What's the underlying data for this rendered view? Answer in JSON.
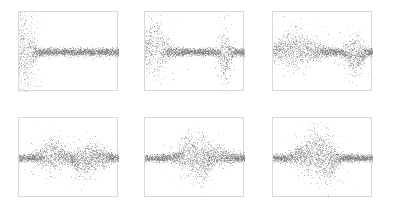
{
  "figure": {
    "title": "",
    "background_color": "#ffffff",
    "width": 395,
    "height": 210,
    "panel_border_color": "#d8d8d8",
    "point_color": "#7a7a7a",
    "point_alpha": 0.55,
    "point_size": 0.9,
    "rows": 2,
    "cols": 3
  },
  "chart_data": {
    "type": "scatter",
    "title": "",
    "subtitle": "",
    "xlabel": "",
    "ylabel": "",
    "grid": false,
    "legend": null,
    "shared_axes": {
      "xlim": [
        0,
        1
      ],
      "ylim": [
        -1,
        1
      ],
      "xticks": [],
      "yticks": [],
      "tick_labels_visible": false,
      "axis_labels_visible": false
    },
    "panels": [
      {
        "id": "panel-1",
        "row": 0,
        "col": 0,
        "position_px": {
          "x": 18,
          "y": 11,
          "width": 100,
          "height": 80
        },
        "n_points": 5200,
        "baseline": 0.0,
        "base_spread": 0.085,
        "seed": 11,
        "bursts": [
          {
            "center": 0.055,
            "width": 0.055,
            "amplitude": 0.78,
            "offset": 0.0,
            "density": 1.0
          },
          {
            "center": 0.02,
            "width": 0.03,
            "amplitude": 0.45,
            "offset": 0.0,
            "density": 0.55
          }
        ],
        "band": {
          "start": 0.0,
          "end": 1.0,
          "spread": 0.085
        },
        "notes": "large symmetric burst at left edge, flat band across remainder"
      },
      {
        "id": "panel-2",
        "row": 0,
        "col": 1,
        "position_px": {
          "x": 144,
          "y": 11,
          "width": 100,
          "height": 80
        },
        "n_points": 5200,
        "baseline": 0.0,
        "base_spread": 0.085,
        "seed": 22,
        "bursts": [
          {
            "center": 0.09,
            "width": 0.075,
            "amplitude": 0.5,
            "offset": 0.1,
            "density": 1.0
          },
          {
            "center": 0.8,
            "width": 0.035,
            "amplitude": 0.46,
            "offset": -0.14,
            "density": 0.85
          }
        ],
        "band": {
          "start": 0.0,
          "end": 1.0,
          "spread": 0.085
        },
        "notes": "upward burst near left, narrow downward burst at ~80% of width"
      },
      {
        "id": "panel-3",
        "row": 0,
        "col": 2,
        "position_px": {
          "x": 272,
          "y": 11,
          "width": 100,
          "height": 80
        },
        "n_points": 5200,
        "baseline": 0.0,
        "base_spread": 0.085,
        "seed": 33,
        "bursts": [
          {
            "center": 0.22,
            "width": 0.14,
            "amplitude": 0.34,
            "offset": 0.09,
            "density": 1.0
          },
          {
            "center": 0.82,
            "width": 0.055,
            "amplitude": 0.32,
            "offset": -0.1,
            "density": 0.9
          }
        ],
        "band": {
          "start": 0.0,
          "end": 1.0,
          "spread": 0.085
        },
        "notes": "broad thick band on left third, downward burst near right"
      },
      {
        "id": "panel-4",
        "row": 1,
        "col": 0,
        "position_px": {
          "x": 18,
          "y": 117,
          "width": 100,
          "height": 80
        },
        "n_points": 5200,
        "baseline": 0.0,
        "base_spread": 0.08,
        "seed": 44,
        "bursts": [
          {
            "center": 0.34,
            "width": 0.075,
            "amplitude": 0.3,
            "offset": 0.11,
            "density": 0.95
          },
          {
            "center": 0.63,
            "width": 0.055,
            "amplitude": 0.3,
            "offset": -0.12,
            "density": 0.9
          },
          {
            "center": 0.78,
            "width": 0.07,
            "amplitude": 0.16,
            "offset": 0.05,
            "density": 0.7
          }
        ],
        "band": {
          "start": 0.0,
          "end": 1.0,
          "spread": 0.08
        },
        "notes": "upward bump at ~34%, downward bump at ~63%, mild rise at ~78%"
      },
      {
        "id": "panel-5",
        "row": 1,
        "col": 1,
        "position_px": {
          "x": 144,
          "y": 117,
          "width": 100,
          "height": 80
        },
        "n_points": 5200,
        "baseline": 0.0,
        "base_spread": 0.08,
        "seed": 55,
        "bursts": [
          {
            "center": 0.45,
            "width": 0.075,
            "amplitude": 0.34,
            "offset": 0.12,
            "density": 1.0
          },
          {
            "center": 0.57,
            "width": 0.05,
            "amplitude": 0.3,
            "offset": -0.13,
            "density": 0.85
          },
          {
            "center": 0.72,
            "width": 0.09,
            "amplitude": 0.14,
            "offset": 0.04,
            "density": 0.7
          }
        ],
        "band": {
          "start": 0.0,
          "end": 1.0,
          "spread": 0.08
        },
        "notes": "central upward spike followed immediately by downward spike"
      },
      {
        "id": "panel-6",
        "row": 1,
        "col": 2,
        "position_px": {
          "x": 272,
          "y": 117,
          "width": 100,
          "height": 80
        },
        "n_points": 5200,
        "baseline": 0.0,
        "base_spread": 0.08,
        "seed": 66,
        "bursts": [
          {
            "center": 0.43,
            "width": 0.085,
            "amplitude": 0.38,
            "offset": 0.13,
            "density": 1.0
          },
          {
            "center": 0.55,
            "width": 0.05,
            "amplitude": 0.32,
            "offset": -0.14,
            "density": 0.85
          },
          {
            "center": 0.3,
            "width": 0.08,
            "amplitude": 0.14,
            "offset": 0.04,
            "density": 0.6
          }
        ],
        "band": {
          "start": 0.0,
          "end": 1.0,
          "spread": 0.08
        },
        "notes": "upward then downward burst just left of center, slight thickening at 30%"
      }
    ]
  }
}
